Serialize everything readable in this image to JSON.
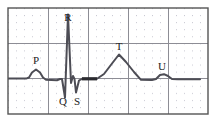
{
  "figure": {
    "background_color": "#ffffff",
    "frame": {
      "x": 8,
      "y": 8,
      "width": 200,
      "height": 106,
      "border_color": "#555555",
      "border_width": 1.4
    },
    "grid": {
      "minor": {
        "color": "#c9c9d2",
        "dot_spacing_x": 8.0,
        "dot_spacing_y": 7.07,
        "style": "dotted"
      },
      "major": {
        "color": "#8d8d95",
        "line_width": 1.0,
        "vertical_x": [
          8,
          48,
          88,
          128,
          168,
          208
        ],
        "horizontal_y": [
          8,
          43.3,
          78.6,
          114
        ]
      }
    },
    "trace": {
      "color": "#4d4d55",
      "line_width": 2.0,
      "baseline_y": 78.6,
      "st_segment_color": "#2b2b30",
      "st_segment_width": 3.2
    }
  },
  "chart_data": {
    "type": "line",
    "xlabel": "",
    "ylabel": "",
    "grid": true,
    "legend": "none",
    "series": [
      {
        "name": "ECG trace",
        "points": [
          [
            8,
            78.6
          ],
          [
            26,
            78.6
          ],
          [
            29,
            77.5
          ],
          [
            32,
            72.5
          ],
          [
            36,
            69.5
          ],
          [
            40,
            72.5
          ],
          [
            43,
            77.5
          ],
          [
            46,
            79.8
          ],
          [
            57,
            80.2
          ],
          [
            60,
            79.0
          ],
          [
            62,
            79.0
          ],
          [
            65,
            97.5
          ],
          [
            68,
            14.5
          ],
          [
            71,
            83.0
          ],
          [
            73,
            76.0
          ],
          [
            74.5,
            79.0
          ],
          [
            76,
            92.5
          ],
          [
            79,
            80.5
          ],
          [
            82,
            78.8
          ],
          [
            97,
            78.8
          ],
          [
            104,
            74.0
          ],
          [
            112,
            63.5
          ],
          [
            119,
            54.5
          ],
          [
            126,
            62.0
          ],
          [
            134,
            72.0
          ],
          [
            141,
            79.8
          ],
          [
            152,
            80.0
          ],
          [
            156,
            79.0
          ],
          [
            160,
            75.0
          ],
          [
            164,
            74.2
          ],
          [
            168,
            76.0
          ],
          [
            172,
            79.0
          ],
          [
            178,
            79.2
          ],
          [
            200,
            79.2
          ]
        ]
      }
    ],
    "st_segment": {
      "name": "ST segment (bold)",
      "points": [
        [
          82,
          78.8
        ],
        [
          97,
          78.8
        ]
      ]
    },
    "annotations": [
      {
        "label": "P",
        "x": 36,
        "y": 64,
        "wave": "P-wave",
        "description": "atrial depolarization"
      },
      {
        "label": "R",
        "x": 68,
        "y": 21,
        "wave": "R-wave",
        "description": "peak of QRS complex"
      },
      {
        "label": "Q",
        "x": 63,
        "y": 105,
        "wave": "Q-wave",
        "description": "initial negative deflection"
      },
      {
        "label": "S",
        "x": 77,
        "y": 105,
        "wave": "S-wave",
        "description": "terminal negative deflection"
      },
      {
        "label": "T",
        "x": 119,
        "y": 50,
        "wave": "T-wave",
        "description": "ventricular repolarization"
      },
      {
        "label": "U",
        "x": 162,
        "y": 70,
        "wave": "U-wave",
        "description": "small late deflection"
      }
    ]
  }
}
